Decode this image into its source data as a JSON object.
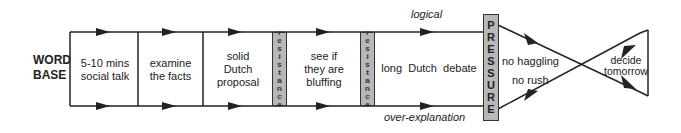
{
  "start_label": {
    "line1": "WORD",
    "line2": "BASE"
  },
  "stages": [
    {
      "line1": "5-10 mins",
      "line2": "social talk"
    },
    {
      "line1": "examine",
      "line2": "the facts"
    },
    {
      "line1": "solid",
      "line2": "Dutch",
      "line3": "proposal"
    },
    {
      "line1": "see if",
      "line2": "they are",
      "line3": "bluffing"
    },
    {
      "line1": "long  Dutch  debate"
    }
  ],
  "resistance": "resistance",
  "pressure": "PRESSURE",
  "top_path_label": "logical",
  "bottom_path_label": "over-explanation",
  "after_pressure": {
    "upper": "no haggling",
    "lower": "no rush"
  },
  "outcome": {
    "line1": "decide",
    "line2": "tomorrow"
  },
  "colors": {
    "line": "#222222",
    "bar_fill": "#b8b8b8"
  }
}
